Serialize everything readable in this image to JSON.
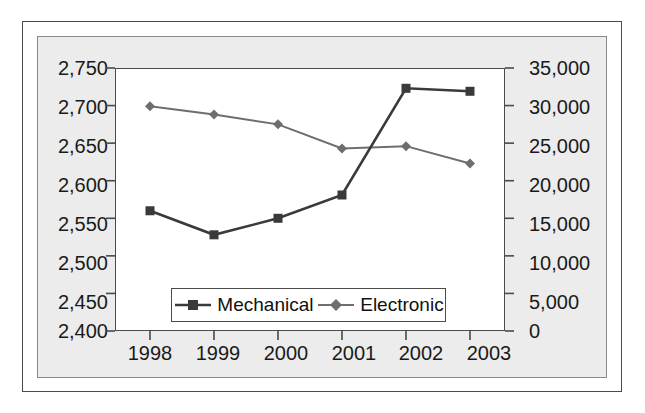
{
  "chart_data": {
    "type": "line",
    "title": "",
    "subtitle": "",
    "xlabel": "",
    "ylabel": "",
    "grid": false,
    "legend_position": "inside-bottom-center",
    "categories": [
      "1998",
      "1999",
      "2000",
      "2001",
      "2002",
      "2003"
    ],
    "axes": {
      "x": {
        "tick_labels": [
          "1998",
          "1999",
          "2000",
          "2001",
          "2002",
          "2003"
        ]
      },
      "y_left": {
        "label": "",
        "min": 2400,
        "max": 2750,
        "step": 50,
        "tick_labels": [
          "2,750",
          "2,700",
          "2,650",
          "2,600",
          "2,550",
          "2,500",
          "2,450",
          "2,400"
        ],
        "tick_values": [
          2750,
          2700,
          2650,
          2600,
          2550,
          2500,
          2450,
          2400
        ]
      },
      "y_right": {
        "label": "",
        "min": 0,
        "max": 35000,
        "step": 5000,
        "tick_labels": [
          "35,000",
          "30,000",
          "25,000",
          "20,000",
          "15,000",
          "10,000",
          "5,000",
          "0"
        ],
        "tick_values": [
          35000,
          30000,
          25000,
          20000,
          15000,
          10000,
          5000,
          0
        ]
      }
    },
    "series": [
      {
        "name": "Mechanical",
        "axis": "y_left",
        "color": "#3a3a3a",
        "marker": "square",
        "values": [
          2560,
          2528,
          2550,
          2581,
          2723,
          2719
        ]
      },
      {
        "name": "Electronic",
        "axis": "y_right",
        "color": "#6e6e6e",
        "marker": "diamond",
        "values": [
          29900,
          28800,
          27500,
          24300,
          24600,
          22300
        ]
      }
    ],
    "legend": [
      {
        "label": "Mechanical",
        "marker": "square",
        "color": "#3a3a3a"
      },
      {
        "label": "Electronic",
        "marker": "diamond",
        "color": "#6e6e6e"
      }
    ]
  },
  "colors": {
    "mechanical": "#3a3a3a",
    "electronic": "#6e6e6e",
    "panel_background": "#ececec",
    "plot_background": "#ffffff",
    "frame": "#4a4a4a",
    "text": "#1a1a1a"
  }
}
